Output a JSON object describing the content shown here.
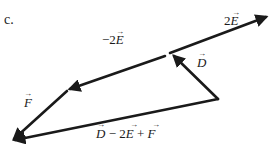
{
  "part_label": "c.",
  "diagram": {
    "type": "vector-addition",
    "vectors": [
      {
        "id": "twoE",
        "name": "2E",
        "label": "2",
        "symbol": "E",
        "arrow": "→"
      },
      {
        "id": "D",
        "name": "D",
        "label": "",
        "symbol": "D",
        "arrow": "→"
      },
      {
        "id": "negTwoE",
        "name": "-2E",
        "label": "−2",
        "symbol": "E",
        "arrow": "→"
      },
      {
        "id": "F",
        "name": "F",
        "label": "",
        "symbol": "F",
        "arrow": "→"
      },
      {
        "id": "resultant",
        "name": "D - 2E + F",
        "label": "",
        "symbol": "D − 2E + F",
        "arrow": "→"
      }
    ],
    "labels": {
      "twoE_coef": "2",
      "twoE_sym": "E",
      "negTwoE_coef": "−2",
      "negTwoE_sym": "E",
      "D_sym": "D",
      "F_sym": "F",
      "res_D": "D",
      "res_minus": " − 2",
      "res_E": "E",
      "res_plus": " + ",
      "res_F": "F",
      "arrow_glyph": "→"
    },
    "color": "#1a1a1a"
  }
}
